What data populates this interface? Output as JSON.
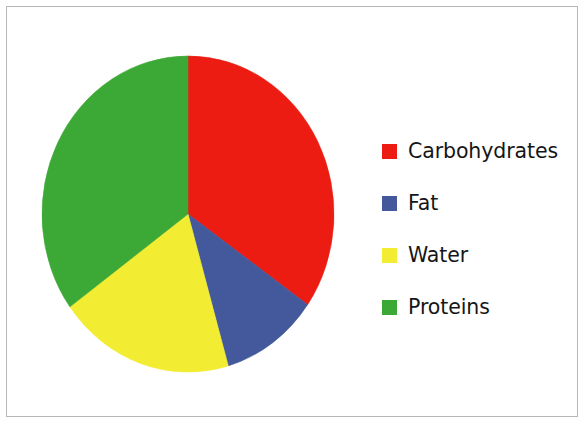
{
  "figure": {
    "width": 586,
    "height": 425,
    "background_color": "#ffffff",
    "border_color": "#b6b6b6"
  },
  "legend": {
    "position": "right",
    "items": [
      {
        "label": "Carbohydrates",
        "color": "#ED1C13",
        "swatch_name": "legend-swatch-carbohydrates"
      },
      {
        "label": "Fat",
        "color": "#43599B",
        "swatch_name": "legend-swatch-fat"
      },
      {
        "label": "Water",
        "color": "#F2EC32",
        "swatch_name": "legend-swatch-water"
      },
      {
        "label": "Proteins",
        "color": "#3CA835",
        "swatch_name": "legend-swatch-proteins"
      }
    ]
  },
  "chart_data": {
    "type": "pie",
    "title": "",
    "subtitle": "",
    "xlabel": "",
    "ylabel": "",
    "grid": false,
    "legend_position": "right",
    "start_angle_deg": 0,
    "direction": "clockwise",
    "center": {
      "x": 188,
      "y": 214
    },
    "radius_x": 146,
    "radius_y": 158,
    "labels": [
      "Carbohydrates",
      "Fat",
      "Water",
      "Proteins"
    ],
    "values": [
      34.7,
      10.8,
      19.5,
      35.0
    ],
    "units": "percent",
    "colors": [
      "#ED1C13",
      "#43599B",
      "#F2EC32",
      "#3CA835"
    ],
    "slices": [
      {
        "label": "Carbohydrates",
        "value": 34.7,
        "color": "#ED1C13",
        "start_angle_deg": 0,
        "end_angle_deg": 125
      },
      {
        "label": "Fat",
        "value": 10.8,
        "color": "#43599B",
        "start_angle_deg": 125,
        "end_angle_deg": 164
      },
      {
        "label": "Water",
        "value": 19.5,
        "color": "#F2EC32",
        "start_angle_deg": 164,
        "end_angle_deg": 234
      },
      {
        "label": "Proteins",
        "value": 35.0,
        "color": "#3CA835",
        "start_angle_deg": 234,
        "end_angle_deg": 360
      }
    ]
  }
}
